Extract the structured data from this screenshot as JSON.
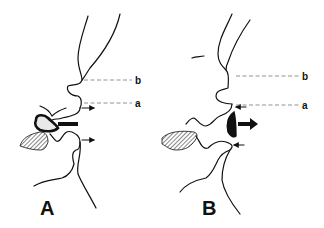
{
  "figure": {
    "panels": [
      {
        "id": "A",
        "label": "A",
        "ref_lines": [
          {
            "label": "b"
          },
          {
            "label": "a"
          }
        ],
        "arrows": {
          "large": "leftward",
          "small": [
            "rightward-upper",
            "rightward-lower"
          ]
        }
      },
      {
        "id": "B",
        "label": "B",
        "ref_lines": [
          {
            "label": "b"
          },
          {
            "label": "a"
          }
        ],
        "arrows": {
          "large": "rightward",
          "small": [
            "leftward-upper",
            "leftward-lower"
          ]
        }
      }
    ],
    "colors": {
      "line": "#111111",
      "dashed": "#777777",
      "background": "#ffffff"
    }
  }
}
